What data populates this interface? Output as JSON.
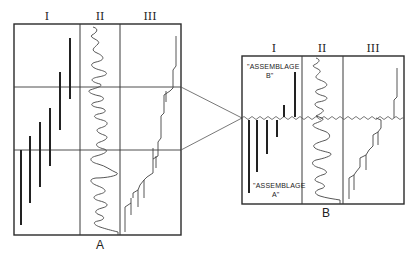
{
  "diagram": {
    "panels": [
      {
        "id": "A",
        "label": "A",
        "columns": [
          {
            "numeral": "I"
          },
          {
            "numeral": "II"
          },
          {
            "numeral": "III"
          }
        ]
      },
      {
        "id": "B",
        "label": "B",
        "columns": [
          {
            "numeral": "I"
          },
          {
            "numeral": "II"
          },
          {
            "numeral": "III"
          }
        ],
        "annotations": {
          "upper_line1": "\"ASSEMBLAGE",
          "upper_line2": "B\"",
          "lower_line1": "\"ASSEMBLAGE",
          "lower_line2": "A\""
        }
      }
    ],
    "colors": {
      "line": "#2a2a2a",
      "background": "#ffffff"
    }
  }
}
